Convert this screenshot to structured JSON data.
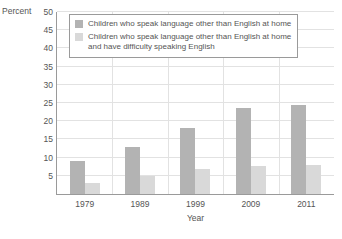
{
  "chart_data": {
    "type": "bar",
    "title": "",
    "xlabel": "Year",
    "ylabel": "Percent",
    "categories": [
      "1979",
      "1989",
      "1999",
      "2009",
      "2011"
    ],
    "series": [
      {
        "name": "Children who speak language other than English at home",
        "color": "#b3b3b3",
        "values": [
          9,
          13,
          18,
          23.5,
          24.5
        ]
      },
      {
        "name": "Children who speak language other than English at home\nand have difficulty speaking English",
        "color": "#d9d9d9",
        "values": [
          3,
          5,
          7,
          7.8,
          8
        ]
      }
    ],
    "ylim": [
      0,
      50
    ],
    "yticks": [
      5,
      10,
      15,
      20,
      25,
      30,
      35,
      40,
      45,
      50
    ],
    "ytick_labels": [
      "5",
      "10",
      "15",
      "20",
      "25",
      "30",
      "35",
      "40",
      "45",
      "50"
    ],
    "grid": true,
    "legend_position": "top-left-inside"
  },
  "axes": {
    "y_title": "Percent",
    "x_title": "Year"
  },
  "legend": {
    "items": [
      {
        "label": "Children who speak language other than English at home",
        "swatch": "#b3b3b3"
      },
      {
        "label": "Children who speak language other than English at home\nand have difficulty speaking English",
        "swatch": "#d9d9d9"
      }
    ]
  }
}
